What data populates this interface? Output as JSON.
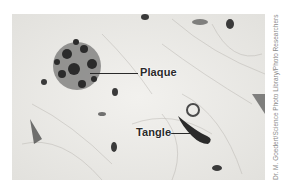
{
  "figure": {
    "labels": {
      "plaque": "Plaque",
      "tangle": "Tangle"
    },
    "credit": "Dr. M. Goedert/Science Photo Library/Photo Researchers",
    "colors": {
      "background": "#ecebe8",
      "stain": "#2b2b2b",
      "label_text": "#2a2a2a",
      "credit_text": "#8a8a8a"
    }
  }
}
